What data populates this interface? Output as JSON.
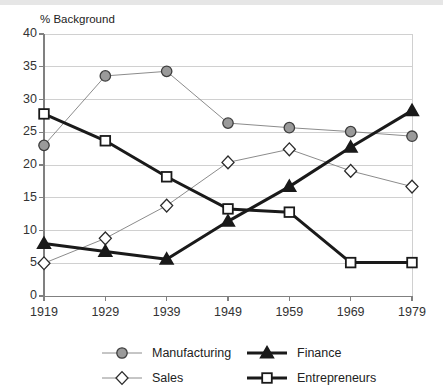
{
  "chart_data": {
    "type": "line",
    "title": "",
    "ylabel": "% Background",
    "xlabel": "",
    "ylim": [
      0,
      40
    ],
    "ytick_step": 5,
    "grid": true,
    "legend_position": "bottom",
    "categories": [
      "1919",
      "1929",
      "1939",
      "1949",
      "1959",
      "1969",
      "1979"
    ],
    "yticks": [
      "0",
      "5",
      "10",
      "15",
      "20",
      "25",
      "30",
      "35",
      "40"
    ],
    "series": [
      {
        "name": "Manufacturing",
        "marker": "circle",
        "marker_fill": "#9a9a9a",
        "marker_stroke": "#3d3d3d",
        "line_color": "#8c8c8c",
        "line_width": 1,
        "values": [
          23.0,
          33.6,
          34.3,
          26.4,
          25.7,
          25.1,
          24.4
        ]
      },
      {
        "name": "Finance",
        "marker": "triangle",
        "marker_fill": "#1a1a1a",
        "marker_stroke": "#1a1a1a",
        "line_color": "#1a1a1a",
        "line_width": 3,
        "values": [
          8.0,
          6.8,
          5.6,
          11.4,
          16.7,
          22.7,
          28.3
        ]
      },
      {
        "name": "Sales",
        "marker": "diamond",
        "marker_fill": "#ffffff",
        "marker_stroke": "#2b2b2b",
        "line_color": "#8c8c8c",
        "line_width": 1,
        "values": [
          5.0,
          8.8,
          13.8,
          20.4,
          22.4,
          19.1,
          16.7
        ]
      },
      {
        "name": "Entrepreneurs",
        "marker": "square",
        "marker_fill": "#ffffff",
        "marker_stroke": "#1a1a1a",
        "line_color": "#1a1a1a",
        "line_width": 3,
        "values": [
          27.8,
          23.7,
          18.2,
          13.3,
          12.8,
          5.1,
          5.1
        ]
      }
    ]
  },
  "legend": {
    "entries": [
      {
        "label": "Manufacturing"
      },
      {
        "label": "Finance"
      },
      {
        "label": "Sales"
      },
      {
        "label": "Entrepreneurs"
      }
    ]
  },
  "colors": {
    "axis": "#808080",
    "grid": "#d0d0d0",
    "text": "#333333",
    "top_bar": "#e6e6e6"
  }
}
